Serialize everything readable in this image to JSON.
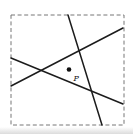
{
  "figure": {
    "background_color": "#ffffff",
    "shadow_color": "#bfbfbf",
    "line_color": "#1c1c1c",
    "line_width": 1.5,
    "square": {
      "x": 11,
      "y": 15,
      "width": 113,
      "height": 110,
      "stroke": "#777777",
      "stroke_width": 1,
      "dash": "4 2.6"
    },
    "lines": [
      {
        "name": "line-steep",
        "x1": 68,
        "y1": 15,
        "x2": 102,
        "y2": 125
      },
      {
        "name": "line-rising",
        "x1": 11,
        "y1": 86,
        "x2": 123,
        "y2": 28
      },
      {
        "name": "line-descending",
        "x1": 11,
        "y1": 58,
        "x2": 123,
        "y2": 104
      }
    ],
    "point": {
      "label": "P",
      "cx": 69,
      "cy": 69.5,
      "r": 2.3,
      "color": "#111111",
      "label_x": 73.5,
      "label_y": 80.5,
      "label_font_size": 8
    }
  }
}
